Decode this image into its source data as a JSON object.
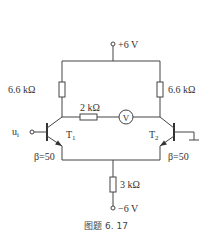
{
  "supply": {
    "positive": "+6 V",
    "negative": "−6 V"
  },
  "resistors": {
    "rc1": "6.6 kΩ",
    "rc2": "6.6 kΩ",
    "rl": "2 kΩ",
    "re": "3 kΩ"
  },
  "meter": {
    "symbol": "V"
  },
  "transistors": {
    "t1": {
      "name": "T",
      "sub": "1",
      "beta": "β=50"
    },
    "t2": {
      "name": "T",
      "sub": "2",
      "beta": "β=50"
    }
  },
  "input": {
    "name": "u",
    "sub": "i"
  },
  "caption": "图题 6. 17"
}
